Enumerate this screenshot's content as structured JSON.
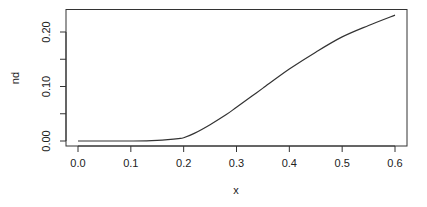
{
  "chart_data": {
    "type": "line",
    "title": "",
    "xlabel": "x",
    "ylabel": "nd",
    "xlim": [
      -0.024,
      0.624
    ],
    "ylim": [
      -0.009,
      0.24
    ],
    "xticks": [
      0.0,
      0.1,
      0.2,
      0.3,
      0.4,
      0.5,
      0.6
    ],
    "xtick_labels": [
      "0.0",
      "0.1",
      "0.2",
      "0.3",
      "0.4",
      "0.5",
      "0.6"
    ],
    "yticks": [
      0.0,
      0.05,
      0.1,
      0.15,
      0.2
    ],
    "ytick_labels": [
      "0.00",
      "",
      "0.10",
      "",
      "0.20"
    ],
    "grid": false,
    "legend": null,
    "series": [
      {
        "name": "nd",
        "color": "#333333",
        "x": [
          0.0,
          0.05,
          0.1,
          0.13,
          0.15,
          0.17,
          0.19,
          0.2,
          0.22,
          0.25,
          0.28,
          0.3,
          0.33,
          0.35,
          0.4,
          0.45,
          0.5,
          0.55,
          0.6
        ],
        "y": [
          0.0,
          0.0,
          0.0,
          0.0002,
          0.001,
          0.0025,
          0.0045,
          0.006,
          0.014,
          0.03,
          0.048,
          0.062,
          0.083,
          0.097,
          0.132,
          0.163,
          0.191,
          0.212,
          0.231
        ]
      }
    ]
  }
}
